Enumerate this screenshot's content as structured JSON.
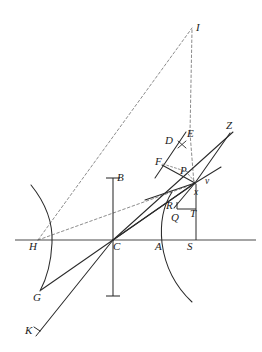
{
  "figure": {
    "type": "line-diagram",
    "width": 262,
    "height": 352,
    "background_color": "#ffffff",
    "stroke_color": "#2b2b2b",
    "dashed_color": "#6e6e6e",
    "axis_color": "#4a4a4a"
  },
  "labels": [
    {
      "id": "I",
      "text": "I",
      "x": 196,
      "y": 22,
      "size": "normal"
    },
    {
      "id": "Z",
      "text": "Z",
      "x": 226,
      "y": 120,
      "size": "normal"
    },
    {
      "id": "E",
      "text": "E",
      "x": 187,
      "y": 128,
      "size": "normal"
    },
    {
      "id": "D",
      "text": "D",
      "x": 165,
      "y": 135,
      "size": "normal"
    },
    {
      "id": "F",
      "text": "F",
      "x": 155,
      "y": 156,
      "size": "normal"
    },
    {
      "id": "P",
      "text": "P",
      "x": 180,
      "y": 165,
      "size": "normal"
    },
    {
      "id": "v",
      "text": "v",
      "x": 205,
      "y": 177,
      "size": "small"
    },
    {
      "id": "x",
      "text": "x",
      "x": 194,
      "y": 188,
      "size": "small"
    },
    {
      "id": "B",
      "text": "B",
      "x": 117,
      "y": 172,
      "size": "normal"
    },
    {
      "id": "R",
      "text": "R",
      "x": 166,
      "y": 200,
      "size": "normal"
    },
    {
      "id": "Q",
      "text": "Q",
      "x": 171,
      "y": 212,
      "size": "normal"
    },
    {
      "id": "T",
      "text": "T",
      "x": 190,
      "y": 208,
      "size": "normal"
    },
    {
      "id": "H",
      "text": "H",
      "x": 29,
      "y": 241,
      "size": "normal"
    },
    {
      "id": "C",
      "text": "C",
      "x": 113,
      "y": 241,
      "size": "normal"
    },
    {
      "id": "A",
      "text": "A",
      "x": 155,
      "y": 241,
      "size": "normal"
    },
    {
      "id": "S",
      "text": "S",
      "x": 187,
      "y": 241,
      "size": "normal"
    },
    {
      "id": "G",
      "text": "G",
      "x": 33,
      "y": 292,
      "size": "normal"
    },
    {
      "id": "K",
      "text": "K",
      "x": 25,
      "y": 325,
      "size": "normal"
    }
  ],
  "points": {
    "I": [
      192,
      27
    ],
    "Z_end": [
      233,
      131
    ],
    "E_top": [
      190,
      133
    ],
    "D": [
      171,
      144
    ],
    "F": [
      163,
      164
    ],
    "P_vertex": [
      195,
      183
    ],
    "B_top": [
      125,
      178
    ],
    "B_bot": [
      125,
      296
    ],
    "R": [
      175,
      205
    ],
    "Q": [
      178,
      214
    ],
    "T": [
      196,
      213
    ],
    "S": [
      196,
      240
    ],
    "H": [
      38,
      240
    ],
    "C": [
      113,
      240
    ],
    "A": [
      162,
      240
    ],
    "G": [
      41,
      290
    ],
    "K": [
      40,
      332
    ],
    "axis_left": [
      15,
      240
    ],
    "axis_right": [
      256,
      240
    ]
  },
  "segments": {
    "axis": "horizontal optical axis H-C-A-S",
    "vertical_bar": "lens plane through C labelled B",
    "left_arc": "concave mirror arc through H",
    "right_arc": "refracting surface arc through A",
    "dashed_rays": "H-I, C-I vertical, H-to-P dashed",
    "solid_rays": "C-Z, C-v, G-P, K-P, F-E, Q-R-T box"
  }
}
